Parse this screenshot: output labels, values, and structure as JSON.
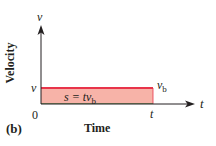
{
  "figure": {
    "panel_label": "(b)",
    "y_axis": {
      "title": "Velocity",
      "symbol": "v"
    },
    "x_axis": {
      "title": "Time",
      "symbol": "t"
    },
    "origin_label": "0",
    "y_tick_label": "v",
    "x_tick_label": "t",
    "line_label": {
      "main": "v",
      "sub": "b"
    },
    "area_label": {
      "prefix": "s = t",
      "var": "v",
      "sub": "b"
    },
    "colors": {
      "axis": "#231f20",
      "velocity_line": "#e8344a",
      "area_fill": "#f7b3a8",
      "area_border": "#6b8f5a"
    }
  }
}
